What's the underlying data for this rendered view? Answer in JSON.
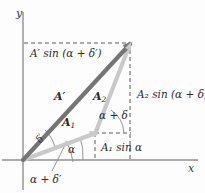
{
  "figure": {
    "type": "vector-addition-phasor-diagram",
    "background_color": "#fdfdfd",
    "width": 205,
    "height": 193
  },
  "axes": {
    "x_label": "x",
    "y_label": "y",
    "axis_color": "#8a8a8a",
    "origin": {
      "x": 23,
      "y": 160
    }
  },
  "vectors": [
    {
      "name": "A-prime",
      "label": "A",
      "label_prime": "′",
      "color": "#707070",
      "from": {
        "x": 23,
        "y": 160
      },
      "to": {
        "x": 130,
        "y": 43
      },
      "label_pos": {
        "x": 54,
        "y": 96
      }
    },
    {
      "name": "A1",
      "label": "A",
      "label_sub": "1",
      "color": "#c8c8c8",
      "from": {
        "x": 23,
        "y": 160
      },
      "to": {
        "x": 95,
        "y": 133
      },
      "label_pos": {
        "x": 62,
        "y": 120
      }
    },
    {
      "name": "A2",
      "label": "A",
      "label_sub": "2",
      "color": "#c8c8c8",
      "from": {
        "x": 95,
        "y": 133
      },
      "to": {
        "x": 130,
        "y": 43
      },
      "label_pos": {
        "x": 93,
        "y": 96
      }
    }
  ],
  "projections": {
    "top_vertical_label": "A′ sin (α + δ′)",
    "right_vertical_label": "A₂ sin (α + δ)",
    "lower_vertical_label": "A₁ sin α",
    "dash_color": "#555555"
  },
  "angles": [
    {
      "name": "delta-prime",
      "label": "δ′",
      "vertex": "origin",
      "between": [
        "A1",
        "A-prime"
      ],
      "label_pos": {
        "x": 35,
        "y": 143
      }
    },
    {
      "name": "alpha",
      "label": "α",
      "vertex": "origin",
      "between": [
        "x-axis",
        "A1"
      ],
      "label_pos": {
        "x": 69,
        "y": 148
      }
    },
    {
      "name": "alpha-plus-delta",
      "label": "α + δ",
      "vertex": "junction",
      "between": [
        "horizontal-dashed",
        "A2"
      ],
      "label_pos": {
        "x": 99,
        "y": 114
      }
    },
    {
      "name": "alpha-plus-delta-prime",
      "label": "α + δ′",
      "vertex": "origin",
      "between": [
        "x-axis",
        "A-prime"
      ],
      "label_pos": {
        "x": 39,
        "y": 176
      }
    }
  ],
  "labels": {
    "top_projection": {
      "base": "A",
      "prime": "′",
      "rest": " sin (α + δ′)",
      "pos": {
        "x": 30,
        "y": 53
      }
    },
    "right_projection": {
      "base": "A",
      "sub": "2",
      "rest": " sin (α + δ)",
      "pos": {
        "x": 136,
        "y": 94
      }
    },
    "lower_projection": {
      "base": "A",
      "sub": "1",
      "rest": " sin α",
      "pos": {
        "x": 100,
        "y": 147
      }
    }
  }
}
